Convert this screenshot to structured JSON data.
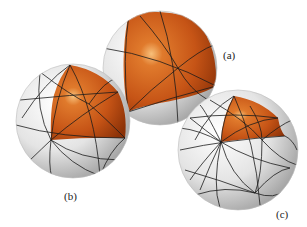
{
  "figure": {
    "colors": {
      "octant": "#c8581a",
      "octant_highlight": "#f5b068",
      "sphere": "#e6e6e6",
      "sphere_shadow": "#a8a8a8",
      "edge": "#1c1c1c",
      "background": "#ffffff"
    },
    "spheres": [
      {
        "id": "a",
        "label": "(a)",
        "subdivision": "coarse",
        "cx": 160,
        "cy": 68,
        "r": 57
      },
      {
        "id": "b",
        "label": "(b)",
        "subdivision": "medium",
        "cx": 73,
        "cy": 121,
        "r": 57
      },
      {
        "id": "c",
        "label": "(c)",
        "subdivision": "fine",
        "cx": 238,
        "cy": 150,
        "r": 60
      }
    ]
  },
  "labels": {
    "a": "(a)",
    "b": "(b)",
    "c": "(c)"
  }
}
